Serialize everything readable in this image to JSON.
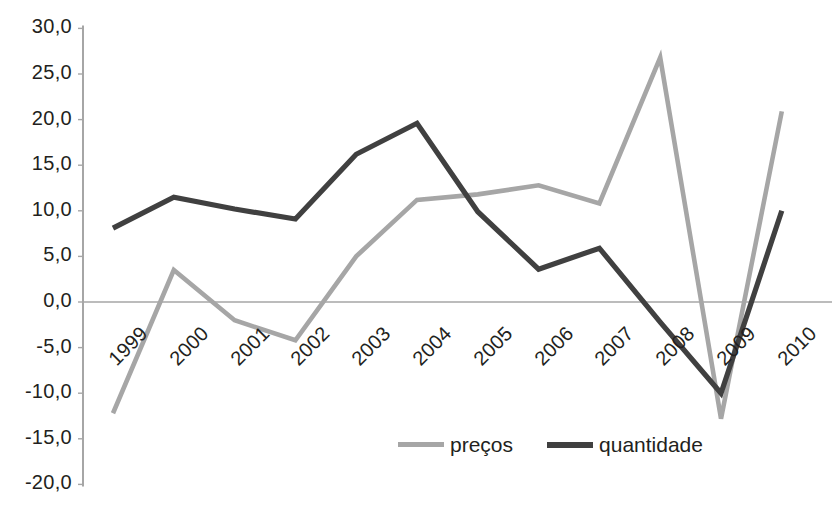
{
  "chart_data": {
    "type": "line",
    "title": "",
    "xlabel": "",
    "ylabel": "",
    "categories": [
      "1999",
      "2000",
      "2001",
      "2002",
      "2003",
      "2004",
      "2005",
      "2006",
      "2007",
      "2008",
      "2009",
      "2010"
    ],
    "series": [
      {
        "name": "preços",
        "color": "#a6a6a6",
        "values": [
          -12.2,
          3.5,
          -2.0,
          -4.2,
          5.0,
          11.2,
          11.8,
          12.8,
          10.8,
          26.8,
          -12.8,
          20.9
        ]
      },
      {
        "name": "quantidade",
        "color": "#404040",
        "values": [
          8.1,
          11.5,
          10.2,
          9.1,
          16.2,
          19.6,
          9.9,
          3.6,
          5.9,
          -2.2,
          -10.0,
          10.0
        ]
      }
    ],
    "ylim": [
      -20.0,
      30.0
    ],
    "ytick_values": [
      30.0,
      25.0,
      20.0,
      15.0,
      10.0,
      5.0,
      0.0,
      -5.0,
      -10.0,
      -15.0,
      -20.0
    ],
    "ytick_labels": [
      "30,0",
      "25,0",
      "20,0",
      "15,0",
      "10,0",
      "5,0",
      "0,0",
      "-5,0",
      "-10,0",
      "-15,0",
      "-20,0"
    ],
    "grid": false,
    "zero_line": true,
    "legend_position": "bottom",
    "axis_color": "#a6a6a6",
    "decimal_separator": ","
  },
  "legend": {
    "entries": [
      {
        "label": "preços",
        "color": "#a6a6a6"
      },
      {
        "label": "quantidade",
        "color": "#404040"
      }
    ]
  }
}
